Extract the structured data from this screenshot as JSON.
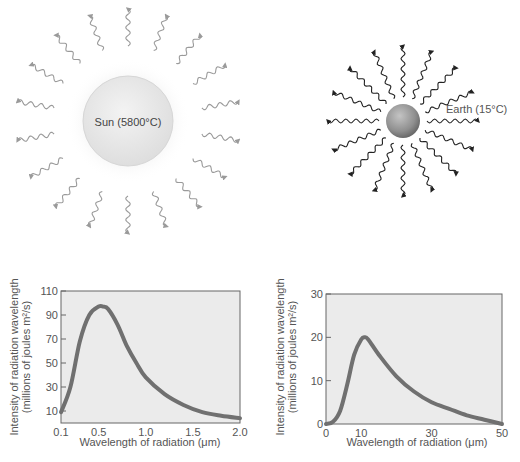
{
  "sun_panel": {
    "label": "Sun (5800°C)",
    "body_color": "#e9e9e9",
    "ray_color": "#9a9a9a",
    "ray_count": 18
  },
  "earth_panel": {
    "label": "Earth (15°C)",
    "body_color": "#8a8a8a",
    "ray_color": "#222222",
    "ray_count": 16
  },
  "chart_data": [
    {
      "type": "line",
      "title": "Sun emission spectrum",
      "xlabel": "Wavelength of radiation (μm)",
      "ylabel": "Intensity of radiation wavelength (millions of joules m²/s)",
      "xlim": [
        0.1,
        2.0
      ],
      "ylim": [
        0,
        110
      ],
      "xticks": [
        "0.1",
        "0.5",
        "1.0",
        "1.5",
        "2.0"
      ],
      "yticks": [
        "10",
        "30",
        "50",
        "70",
        "90",
        "110"
      ],
      "x": [
        0.1,
        0.2,
        0.3,
        0.4,
        0.5,
        0.55,
        0.6,
        0.7,
        0.8,
        0.9,
        1.0,
        1.2,
        1.4,
        1.6,
        1.8,
        2.0
      ],
      "values": [
        9,
        30,
        68,
        90,
        97,
        97,
        95,
        82,
        64,
        50,
        38,
        24,
        15,
        9,
        6,
        4
      ],
      "grid": false
    },
    {
      "type": "line",
      "title": "Earth emission spectrum",
      "xlabel": "Wavelength of radiation (μm)",
      "ylabel": "Intensity of radiation wavelength (millions of joules m²/s)",
      "xlim": [
        0,
        50
      ],
      "ylim": [
        0,
        30
      ],
      "xticks": [
        "0",
        "10",
        "30",
        "50"
      ],
      "yticks": [
        "0",
        "10",
        "20",
        "30"
      ],
      "x": [
        0,
        2,
        4,
        6,
        8,
        10,
        11,
        12,
        15,
        20,
        25,
        30,
        35,
        40,
        45,
        50
      ],
      "values": [
        0,
        0.5,
        3,
        9,
        16,
        19.5,
        20,
        19.5,
        16,
        11,
        7.5,
        5,
        3.5,
        2,
        1,
        0
      ],
      "grid": false
    }
  ],
  "charts": {
    "left": {
      "ylabel_line1": "Intensity of radiation wavelength",
      "ylabel_line2": "(millions of joules m²/s)",
      "xlabel": "Wavelength of radiation (μm)"
    },
    "right": {
      "ylabel_line1": "Intensity of radiation wavelength",
      "ylabel_line2": "(millions of joules m²/s)",
      "xlabel": "Wavelength of radiation (μm)"
    },
    "plot_bg": "#ebebeb",
    "curve_color": "#707070"
  }
}
